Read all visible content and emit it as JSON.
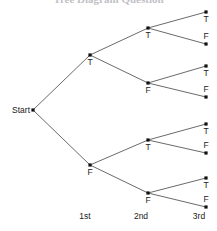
{
  "figure": {
    "kind": "probability-tree-diagram",
    "background_color": "#ffffff",
    "edge_color": "#595959",
    "node_color": "#101010",
    "text_color": "#1a1a1a",
    "width": 217,
    "height": 231
  },
  "title": {
    "text": "Tree Diagram Question",
    "note": "clipped at top edge of screenshot",
    "color": "#8e8e96"
  },
  "start": {
    "label": "Start",
    "x": 33,
    "y": 110
  },
  "stage_labels": [
    {
      "text": "1st",
      "x": 85,
      "y": 212
    },
    {
      "text": "2nd",
      "x": 141,
      "y": 212
    },
    {
      "text": "3rd",
      "x": 199,
      "y": 212
    }
  ],
  "levels": [
    {
      "name": "1st",
      "nodes": [
        {
          "label": "T",
          "x": 90,
          "y": 55,
          "label_pos": "below"
        },
        {
          "label": "F",
          "x": 90,
          "y": 165,
          "label_pos": "below"
        }
      ]
    },
    {
      "name": "2nd",
      "nodes": [
        {
          "label": "T",
          "x": 148,
          "y": 28,
          "label_pos": "below"
        },
        {
          "label": "F",
          "x": 148,
          "y": 83,
          "label_pos": "below"
        },
        {
          "label": "T",
          "x": 148,
          "y": 140,
          "label_pos": "below"
        },
        {
          "label": "F",
          "x": 148,
          "y": 193,
          "label_pos": "below"
        }
      ]
    },
    {
      "name": "3rd",
      "nodes": [
        {
          "label": "T",
          "x": 206,
          "y": 12,
          "label_pos": "below"
        },
        {
          "label": "F",
          "x": 206,
          "y": 44,
          "label_pos": "above"
        },
        {
          "label": "T",
          "x": 206,
          "y": 66,
          "label_pos": "below"
        },
        {
          "label": "F",
          "x": 206,
          "y": 97,
          "label_pos": "above"
        },
        {
          "label": "T",
          "x": 206,
          "y": 124,
          "label_pos": "below"
        },
        {
          "label": "F",
          "x": 206,
          "y": 153,
          "label_pos": "above"
        },
        {
          "label": "T",
          "x": 206,
          "y": 178,
          "label_pos": "below"
        },
        {
          "label": "F",
          "x": 206,
          "y": 207,
          "label_pos": "above"
        }
      ]
    }
  ],
  "edges": [
    {
      "from": [
        33,
        110
      ],
      "to": [
        90,
        55
      ]
    },
    {
      "from": [
        33,
        110
      ],
      "to": [
        90,
        165
      ]
    },
    {
      "from": [
        90,
        55
      ],
      "to": [
        148,
        28
      ]
    },
    {
      "from": [
        90,
        55
      ],
      "to": [
        148,
        83
      ]
    },
    {
      "from": [
        90,
        165
      ],
      "to": [
        148,
        140
      ]
    },
    {
      "from": [
        90,
        165
      ],
      "to": [
        148,
        193
      ]
    },
    {
      "from": [
        148,
        28
      ],
      "to": [
        206,
        12
      ]
    },
    {
      "from": [
        148,
        28
      ],
      "to": [
        206,
        44
      ]
    },
    {
      "from": [
        148,
        83
      ],
      "to": [
        206,
        66
      ]
    },
    {
      "from": [
        148,
        83
      ],
      "to": [
        206,
        97
      ]
    },
    {
      "from": [
        148,
        140
      ],
      "to": [
        206,
        124
      ]
    },
    {
      "from": [
        148,
        140
      ],
      "to": [
        206,
        153
      ]
    },
    {
      "from": [
        148,
        193
      ],
      "to": [
        206,
        178
      ]
    },
    {
      "from": [
        148,
        193
      ],
      "to": [
        206,
        207
      ]
    }
  ]
}
